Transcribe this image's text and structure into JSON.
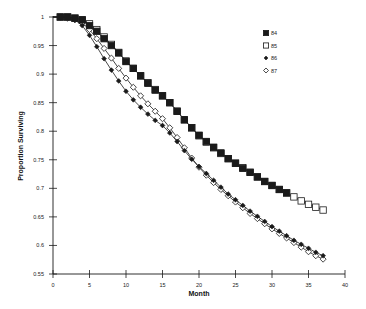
{
  "chart_data": {
    "type": "line",
    "title": "",
    "xlabel": "Month",
    "ylabel": "Proportion Surviving",
    "xlim": [
      0,
      40
    ],
    "ylim": [
      0.55,
      1
    ],
    "x_ticks": [
      0,
      5,
      10,
      15,
      20,
      25,
      30,
      35,
      40
    ],
    "y_ticks": [
      0.55,
      0.6,
      0.65,
      0.7,
      0.75,
      0.8,
      0.85,
      0.9,
      0.95,
      1
    ],
    "x_tick_labels": [
      "0",
      "5",
      "10",
      "15",
      "20",
      "25",
      "30",
      "35",
      "40"
    ],
    "y_tick_labels": [
      "0.55",
      "0.6",
      "0.65",
      "0.7",
      "0.75",
      "0.8",
      "0.85",
      "0.9",
      "0.95",
      "1"
    ],
    "grid": false,
    "legend_position": "upper right",
    "series": [
      {
        "name": "84",
        "marker": "filled-square",
        "x": [
          1,
          2,
          3,
          4,
          5,
          6,
          7,
          8,
          9,
          10,
          11,
          12,
          13,
          14,
          15,
          16,
          17,
          18,
          19,
          20,
          21,
          22,
          23,
          24,
          25,
          26,
          27,
          28,
          29,
          30,
          31,
          32
        ],
        "values": [
          1.0,
          1.0,
          0.998,
          0.995,
          0.985,
          0.975,
          0.962,
          0.95,
          0.937,
          0.922,
          0.91,
          0.897,
          0.884,
          0.872,
          0.862,
          0.85,
          0.835,
          0.82,
          0.806,
          0.793,
          0.782,
          0.772,
          0.762,
          0.752,
          0.744,
          0.735,
          0.728,
          0.72,
          0.712,
          0.705,
          0.698,
          0.692
        ]
      },
      {
        "name": "85",
        "marker": "open-square",
        "x": [
          1,
          2,
          3,
          4,
          5,
          6,
          7,
          8,
          9,
          10,
          11,
          12,
          13,
          14,
          15,
          16,
          17,
          18,
          19,
          20,
          21,
          22,
          23,
          24,
          25,
          26,
          27,
          28,
          29,
          30,
          31,
          32,
          33,
          34,
          35,
          36,
          37
        ],
        "values": [
          1.0,
          1.0,
          0.998,
          0.995,
          0.988,
          0.978,
          0.965,
          0.952,
          0.938,
          0.923,
          0.91,
          0.897,
          0.885,
          0.873,
          0.862,
          0.85,
          0.835,
          0.82,
          0.806,
          0.792,
          0.781,
          0.771,
          0.761,
          0.752,
          0.744,
          0.736,
          0.728,
          0.72,
          0.712,
          0.705,
          0.698,
          0.692,
          0.685,
          0.678,
          0.672,
          0.667,
          0.662
        ]
      },
      {
        "name": "86",
        "marker": "filled-diamond",
        "x": [
          1,
          2,
          3,
          4,
          5,
          6,
          7,
          8,
          9,
          10,
          11,
          12,
          13,
          14,
          15,
          16,
          17,
          18,
          19,
          20,
          21,
          22,
          23,
          24,
          25,
          26,
          27,
          28,
          29,
          30,
          31,
          32,
          33,
          34,
          35,
          36,
          37
        ],
        "values": [
          1.0,
          0.998,
          0.995,
          0.985,
          0.968,
          0.948,
          0.927,
          0.907,
          0.888,
          0.87,
          0.855,
          0.842,
          0.83,
          0.819,
          0.81,
          0.797,
          0.782,
          0.766,
          0.751,
          0.738,
          0.726,
          0.714,
          0.702,
          0.69,
          0.68,
          0.67,
          0.66,
          0.651,
          0.642,
          0.633,
          0.625,
          0.617,
          0.609,
          0.602,
          0.595,
          0.588,
          0.582
        ]
      },
      {
        "name": "87",
        "marker": "open-diamond",
        "x": [
          1,
          2,
          3,
          4,
          5,
          6,
          7,
          8,
          9,
          10,
          11,
          12,
          13,
          14,
          15,
          16,
          17,
          18,
          19,
          20,
          21,
          22,
          23,
          24,
          25,
          26,
          27,
          28,
          29,
          30,
          31,
          32,
          33,
          34,
          35,
          36,
          37
        ],
        "values": [
          1.0,
          0.998,
          0.995,
          0.99,
          0.978,
          0.962,
          0.945,
          0.928,
          0.91,
          0.893,
          0.877,
          0.862,
          0.848,
          0.835,
          0.822,
          0.806,
          0.789,
          0.771,
          0.753,
          0.737,
          0.723,
          0.71,
          0.698,
          0.687,
          0.676,
          0.666,
          0.656,
          0.647,
          0.638,
          0.629,
          0.621,
          0.613,
          0.605,
          0.597,
          0.589,
          0.582,
          0.576
        ]
      }
    ]
  },
  "legend": {
    "items": [
      {
        "label": "84",
        "marker": "filled-square"
      },
      {
        "label": "85",
        "marker": "open-square"
      },
      {
        "label": "86",
        "marker": "filled-diamond"
      },
      {
        "label": "87",
        "marker": "open-diamond"
      }
    ]
  },
  "colors": {
    "ink": "#1a1a1a",
    "background": "#ffffff"
  }
}
